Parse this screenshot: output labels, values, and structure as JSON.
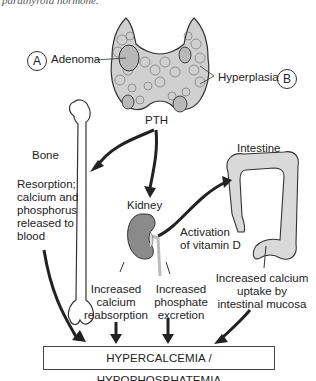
{
  "caption": "parathyroid hormone.",
  "labels": {
    "marker_a": "A",
    "marker_b": "B",
    "adenoma": "Adenoma",
    "hyperplasia": "Hyperplasia",
    "pth": "PTH",
    "bone": "Bone",
    "bone_effect": [
      "Resorption;",
      "calcium and",
      "phosphorus",
      "released to",
      "blood"
    ],
    "kidney": "Kidney",
    "intestine": "Intestine",
    "vitamin_d": [
      "Activation",
      "of vitamin D"
    ],
    "calcium_reabsorption": [
      "Increased",
      "calcium",
      "reabsorption"
    ],
    "phosphate_excretion": [
      "Increased",
      "phosphate",
      "excretion"
    ],
    "calcium_uptake": [
      "Increased calcium",
      "uptake by",
      "intestinal mucosa"
    ]
  },
  "result": "HYPERCALCEMIA / HYPOPHOSPHATEMIA",
  "colors": {
    "gland": "#cfcfcf",
    "kidney": "#8a8a8a",
    "bone": "#ffffff",
    "intestine": "#d9d9d9",
    "arrow": "#222222"
  }
}
